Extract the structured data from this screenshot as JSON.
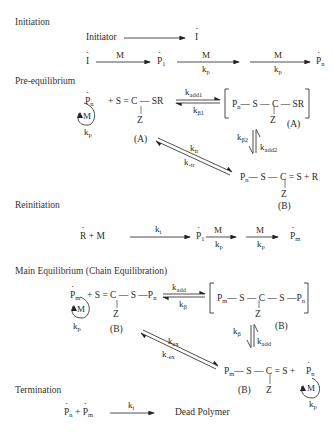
{
  "sections": {
    "initiation": "Initiation",
    "pre_equilibrium": "Pre-equilibrium",
    "reinitiation": "Reinitiation",
    "main_equilibrium": "Main Equilibrium (Chain Equilibration)",
    "termination": "Termination"
  },
  "initiation": {
    "initiator": "Initiator",
    "I": "I",
    "M": "M",
    "P": "P",
    "sub1": "1",
    "subn": "n",
    "kp": "k",
    "kp_sub": "p"
  },
  "pre_eq": {
    "Pn": "P",
    "n": "n",
    "M": "M",
    "kp": "k",
    "p": "p",
    "raft": "+ S = C — SR",
    "Z": "Z",
    "A": "(A)",
    "kadd1": "k",
    "kadd1_sub": "add1",
    "kb1": "k",
    "kb1_sub": "β1",
    "adduct": "P",
    "adduct_rest": "— S — C — SR",
    "Adot": "(A)",
    "kb2": "k",
    "kb2_sub": "β2",
    "kadd2": "k",
    "kadd2_sub": "add2",
    "ktr": "k",
    "ktr_sub": "tr",
    "kmtr": "k",
    "kmtr_sub": "-tr",
    "product": "— S — C = S + R",
    "B": "(B)"
  },
  "reinit": {
    "R": "R",
    "plusM": "+ M",
    "ki": "k",
    "ki_sub": "i",
    "P": "P",
    "sub1": "1",
    "M": "M",
    "kp": "k",
    "p": "p",
    "subm": "m"
  },
  "main_eq": {
    "Pm": "P",
    "m": "m",
    "n": "n",
    "M": "M",
    "kp": "k",
    "p": "p",
    "raft": "+ S = C — S —P",
    "Z": "Z",
    "B": "(B)",
    "kadd": "k",
    "kadd_sub": "add",
    "kb": "k",
    "kb_sub": "β",
    "adduct_rest": "— S — C — S —P",
    "Bdot": "(B)",
    "kex": "k",
    "kex_sub": "ex",
    "kmex": "k",
    "kmex_sub": "-ex",
    "product": "— S — C = S +"
  },
  "termination": {
    "Pn": "P",
    "n": "n",
    "plus": "+",
    "Pm": "P",
    "m": "m",
    "kt": "k",
    "kt_sub": "t",
    "dead": "Dead Polymer"
  }
}
